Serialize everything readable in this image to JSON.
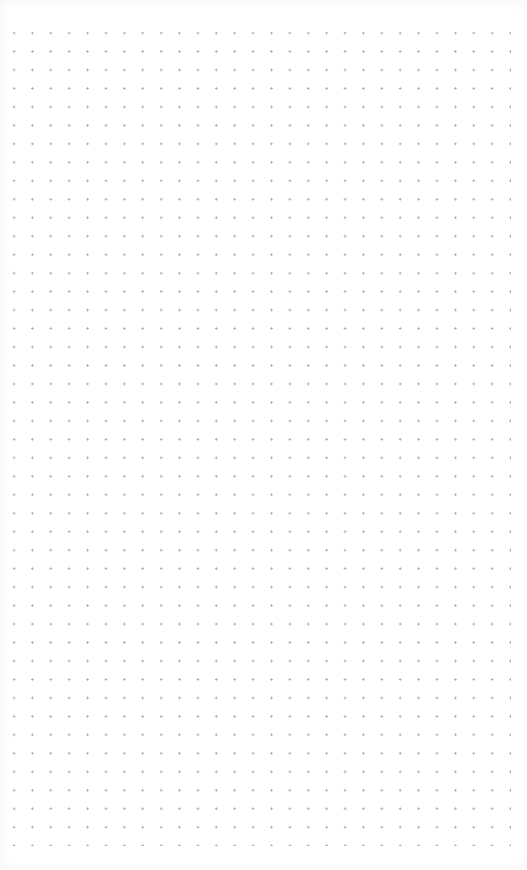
{
  "canvas": {
    "type": "dot-grid",
    "background_color": "#ffffff",
    "dot_color": "#a8a8a8",
    "columns": 27,
    "rows": 44,
    "spacing_px": 18.4
  }
}
